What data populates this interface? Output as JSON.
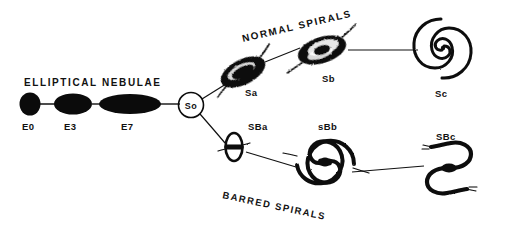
{
  "figure": {
    "background_color": "#ffffff",
    "ink_color": "#0b0b0b",
    "width": 516,
    "height": 232
  },
  "headings": {
    "elliptical": "ELLIPTICAL NEBULAE",
    "normal_spirals": "NORMAL SPIRALS",
    "barred_spirals": "BARRED SPIRALS"
  },
  "hinge": {
    "label": "So",
    "shape": "circle"
  },
  "sequences": {
    "elliptical": {
      "name": "Elliptical nebulae",
      "items": [
        {
          "label": "E0",
          "shape": "ellipse-round",
          "cx": 30,
          "cy": 104,
          "rx": 10.5,
          "ry": 11.5
        },
        {
          "label": "E3",
          "shape": "ellipse-medium",
          "cx": 73,
          "cy": 104,
          "rx": 19,
          "ry": 10.5
        },
        {
          "label": "E7",
          "shape": "ellipse-elongate",
          "cx": 130,
          "cy": 104,
          "rx": 31,
          "ry": 10
        }
      ]
    },
    "normal_spirals": {
      "name": "Normal spirals",
      "items": [
        {
          "label": "Sa",
          "shape": "tight-spiral",
          "cx": 243,
          "cy": 72,
          "angle": -27,
          "openness": "tight"
        },
        {
          "label": "Sb",
          "shape": "medium-spiral",
          "cx": 322,
          "cy": 50,
          "angle": -20,
          "openness": "medium"
        },
        {
          "label": "Sc",
          "shape": "open-spiral",
          "cx": 443,
          "cy": 48,
          "angle": 0,
          "openness": "open"
        }
      ]
    },
    "barred_spirals": {
      "name": "Barred spirals",
      "items": [
        {
          "label": "SBa",
          "shape": "barred-ring",
          "cx": 234,
          "cy": 147,
          "angle": 0,
          "openness": "tight"
        },
        {
          "label": "SBb",
          "shape": "barred-medium-spiral",
          "cx": 325,
          "cy": 162,
          "angle": 0,
          "openness": "medium"
        },
        {
          "label": "SBc",
          "shape": "barred-open-spiral",
          "cx": 449,
          "cy": 168,
          "angle": 0,
          "openness": "open"
        }
      ]
    }
  },
  "labels": {
    "e0": "E0",
    "e3": "E3",
    "e7": "E7",
    "s0": "So",
    "sa": "Sa",
    "sb": "Sb",
    "sc": "Sc",
    "sba": "SBa",
    "sbb": "sBb",
    "sbc": "SBc"
  }
}
